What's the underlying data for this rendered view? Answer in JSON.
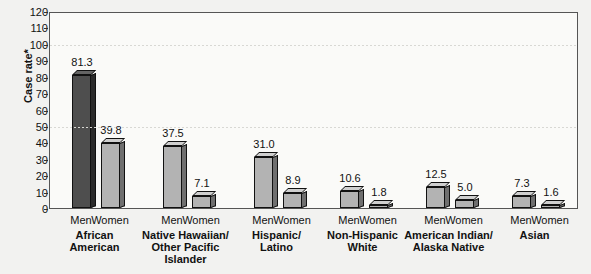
{
  "chart_data": {
    "type": "bar",
    "title": "",
    "xlabel": "",
    "ylabel": "Case rate*",
    "ylim": [
      0,
      120
    ],
    "ytick_step": 10,
    "yticks": [
      0,
      10,
      20,
      30,
      40,
      50,
      60,
      70,
      80,
      90,
      100,
      110,
      120
    ],
    "gridlines_at": [
      50,
      100
    ],
    "grid": true,
    "legend": "none",
    "categories": [
      "African American",
      "Native Hawaiian/ Other Pacific Islander",
      "Hispanic/ Latino",
      "Non-Hispanic White",
      "American Indian/ Alaska Native",
      "Asian"
    ],
    "series": [
      {
        "name": "Men",
        "values": [
          81.3,
          37.5,
          31.0,
          10.6,
          12.5,
          7.3
        ]
      },
      {
        "name": "Women",
        "values": [
          39.8,
          7.1,
          8.9,
          1.8,
          5.0,
          1.6
        ]
      }
    ],
    "colors": {
      "men_first_bar": "#4e4e4e",
      "bar_light": "#b3b3b3",
      "bar_outline": "#111111",
      "gridline": "#d8d8d4",
      "plot_background": "#fafaf8",
      "page_background": "#f2f2f0"
    }
  },
  "axis": {
    "y_title": "Case rate*",
    "tick_labels": [
      "120",
      "110",
      "100",
      "90",
      "80",
      "70",
      "60",
      "50",
      "40",
      "30",
      "20",
      "10",
      "0"
    ]
  },
  "groups": [
    {
      "label_lines": [
        "African",
        "American"
      ],
      "bars": [
        {
          "sex": "Men",
          "value": "81.3",
          "shade": "dark"
        },
        {
          "sex": "Women",
          "value": "39.8",
          "shade": "light"
        }
      ]
    },
    {
      "label_lines": [
        "Native Hawaiian/",
        "Other Pacific",
        "Islander"
      ],
      "bars": [
        {
          "sex": "Men",
          "value": "37.5",
          "shade": "light"
        },
        {
          "sex": "Women",
          "value": "7.1",
          "shade": "light"
        }
      ]
    },
    {
      "label_lines": [
        "Hispanic/",
        "Latino"
      ],
      "bars": [
        {
          "sex": "Men",
          "value": "31.0",
          "shade": "light"
        },
        {
          "sex": "Women",
          "value": "8.9",
          "shade": "light"
        }
      ]
    },
    {
      "label_lines": [
        "Non-Hispanic",
        "White"
      ],
      "bars": [
        {
          "sex": "Men",
          "value": "10.6",
          "shade": "light"
        },
        {
          "sex": "Women",
          "value": "1.8",
          "shade": "light"
        }
      ]
    },
    {
      "label_lines": [
        "American Indian/",
        "Alaska Native"
      ],
      "bars": [
        {
          "sex": "Men",
          "value": "12.5",
          "shade": "light"
        },
        {
          "sex": "Women",
          "value": "5.0",
          "shade": "light"
        }
      ]
    },
    {
      "label_lines": [
        "Asian"
      ],
      "bars": [
        {
          "sex": "Men",
          "value": "7.3",
          "shade": "light"
        },
        {
          "sex": "Women",
          "value": "1.6",
          "shade": "light"
        }
      ]
    }
  ]
}
